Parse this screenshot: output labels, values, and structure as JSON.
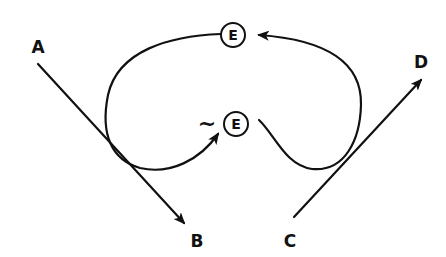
{
  "diagram": {
    "type": "trajectory-diagram",
    "points": {
      "A": {
        "label": "A"
      },
      "B": {
        "label": "B"
      },
      "C": {
        "label": "C"
      },
      "D": {
        "label": "D"
      }
    },
    "nodes": [
      {
        "id": "E_top",
        "label": "E"
      },
      {
        "id": "E_mid",
        "label": "E",
        "prefix_symbol": "~"
      }
    ],
    "edges": [
      {
        "from": "A",
        "to": "B",
        "style": "straight-arrow"
      },
      {
        "from": "C",
        "to": "D",
        "style": "straight-arrow"
      },
      {
        "from": "E_top",
        "to": "E_mid",
        "style": "curved-loop-left-arrow"
      },
      {
        "from": "E_mid",
        "to": "E_top",
        "style": "curved-loop-right-arrow"
      }
    ],
    "colors": {
      "ink": "#111111",
      "background": "#ffffff"
    }
  }
}
